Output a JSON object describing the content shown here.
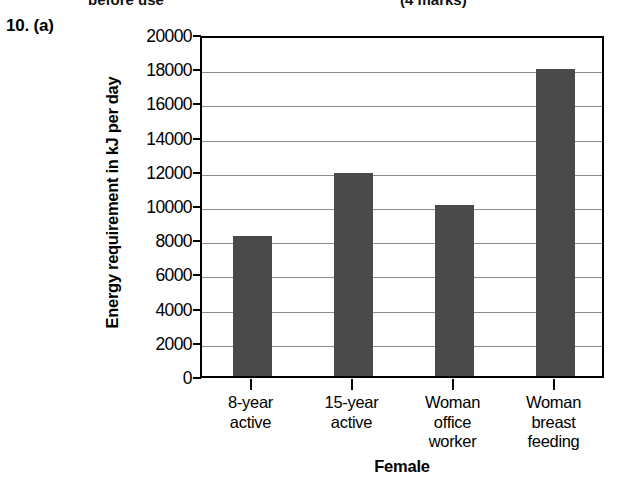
{
  "page": {
    "question_label": "10. (a)",
    "top_remnant_left": "before use",
    "top_remnant_right": "(4 marks)"
  },
  "chart_data": {
    "type": "bar",
    "title": "",
    "categories": [
      "8-year\nactive",
      "15-year\nactive",
      "Woman\noffice\nworker",
      "Woman\nbreast\nfeeding"
    ],
    "values": [
      8200,
      11900,
      10000,
      17950
    ],
    "xlabel": "Female",
    "ylabel": "Energy requirement in kJ per day",
    "ylim": [
      0,
      20000
    ],
    "ytick_step": 2000,
    "yticks": [
      0,
      2000,
      4000,
      6000,
      8000,
      10000,
      12000,
      14000,
      16000,
      18000,
      20000
    ],
    "ytick_labels": [
      "0",
      "2000",
      "4000",
      "6000",
      "8000",
      "10000",
      "12000",
      "14000",
      "16000",
      "18000",
      "20000"
    ],
    "grid": true,
    "grid_axis": "y",
    "legend": false,
    "bar_color": "#4a4a4a",
    "grid_color": "#8c8c8c",
    "axis_color": "#000000",
    "background": "#ffffff"
  }
}
